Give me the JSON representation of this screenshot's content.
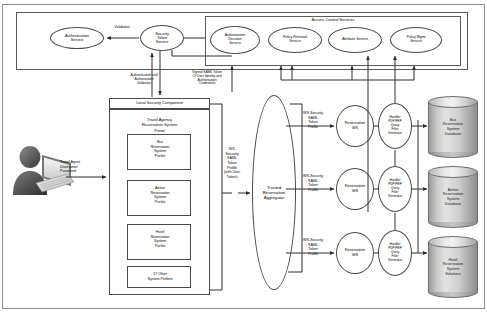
{
  "diagram": {
    "type": "architecture-diagram"
  },
  "security_band": {
    "authentication_service": "Authentication\nService",
    "security_token_service": "Security\nToken\nService",
    "validation_label": "Validation"
  },
  "access_control": {
    "title": "Access Control Services",
    "services": [
      "Authorization\nDecision\nService",
      "Policy Retrieval\nService",
      "Attribute Service",
      "Policy Mgmt\nService"
    ]
  },
  "flows": {
    "auth_validation": "Authentication and\nAuthorization\nValidation",
    "signed_saml": "Signed SAML Token\nOf User Identity and\nAuthorization\nCredentials",
    "user_credentials": "Travel Agent\nUsername/\nPassword",
    "ws_security_user_token": "WS-\nSecurity\nSAML\nToken\nProfile\n(with User\nToken)",
    "ws_security_profile": "WS-Security\nSAML\nToken\nProfile"
  },
  "portal": {
    "local_security_component": "Local Security Component",
    "name": "Travel Agency\nReservation System\nPortal",
    "portlets": [
      "Bus\nReservation\nSystem\nPortlet",
      "Airline\nReservation\nSystem\nPortlet",
      "Hotel\nReservation\nSystem\nPortlet",
      "17 Other\nSystem Portlets"
    ]
  },
  "aggregator": {
    "label": "Trusted\nReservation\nAggregator"
  },
  "services": {
    "reservation_ws": "Reservation\nWS",
    "handler": "Handler\nPDP/PEP\nQuery\nFilter\nGenerator"
  },
  "databases": [
    "Bus\nReservation\nSystem\nDatabase",
    "Airline\nReservation\nSystem\nDatabase",
    "Hotel\nReservation\nSystem\nSolutions"
  ],
  "colors": {
    "stroke": "#4a4a4a",
    "background": "#ffffff",
    "cylinder_light": "#e3e3e3",
    "cylinder_dark": "#8c8c8c"
  }
}
